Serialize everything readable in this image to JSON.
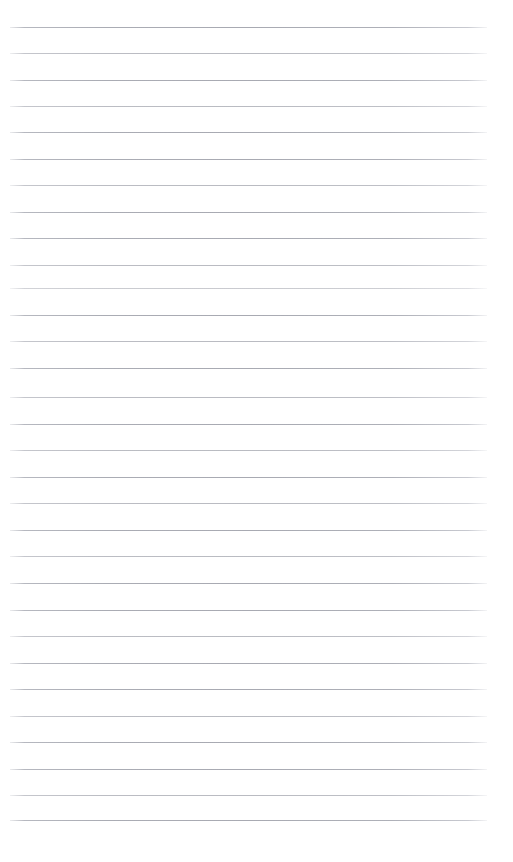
{
  "document": {
    "kind": "lined-paper",
    "title": "Blank ruled paper",
    "background_color": "#ffffff",
    "width_px": 513,
    "height_px": 862,
    "body_text": "",
    "header_text": "",
    "footer_text": ""
  },
  "ruling": {
    "line_color": "#a8aab4",
    "line_thickness_px": 1,
    "line_count": 31,
    "first_line_y": 27,
    "line_spacing_px": 26.4,
    "line_start_x": 10,
    "line_end_x": 487,
    "has_vertical_margin_rule": false,
    "margin_rule_color": "",
    "top_margin_px": 27,
    "bottom_margin_px": 42,
    "left_margin_px": 10,
    "right_margin_px": 26
  },
  "lines": [
    {
      "index": 1,
      "y": 27,
      "opacity_class": ""
    },
    {
      "index": 2,
      "y": 53,
      "opacity_class": "faint"
    },
    {
      "index": 3,
      "y": 80,
      "opacity_class": ""
    },
    {
      "index": 4,
      "y": 106,
      "opacity_class": "faint"
    },
    {
      "index": 5,
      "y": 132,
      "opacity_class": ""
    },
    {
      "index": 6,
      "y": 159,
      "opacity_class": ""
    },
    {
      "index": 7,
      "y": 185,
      "opacity_class": "faint"
    },
    {
      "index": 8,
      "y": 212,
      "opacity_class": ""
    },
    {
      "index": 9,
      "y": 238,
      "opacity_class": ""
    },
    {
      "index": 10,
      "y": 265,
      "opacity_class": "faint"
    },
    {
      "index": 11,
      "y": 288,
      "opacity_class": "faintest"
    },
    {
      "index": 12,
      "y": 315,
      "opacity_class": ""
    },
    {
      "index": 13,
      "y": 341,
      "opacity_class": "faint"
    },
    {
      "index": 14,
      "y": 368,
      "opacity_class": ""
    },
    {
      "index": 15,
      "y": 397,
      "opacity_class": "faint"
    },
    {
      "index": 16,
      "y": 424,
      "opacity_class": ""
    },
    {
      "index": 17,
      "y": 450,
      "opacity_class": "faint"
    },
    {
      "index": 18,
      "y": 477,
      "opacity_class": ""
    },
    {
      "index": 19,
      "y": 503,
      "opacity_class": "faint"
    },
    {
      "index": 20,
      "y": 530,
      "opacity_class": ""
    },
    {
      "index": 21,
      "y": 556,
      "opacity_class": "faint"
    },
    {
      "index": 22,
      "y": 583,
      "opacity_class": ""
    },
    {
      "index": 23,
      "y": 610,
      "opacity_class": ""
    },
    {
      "index": 24,
      "y": 636,
      "opacity_class": "faint"
    },
    {
      "index": 25,
      "y": 663,
      "opacity_class": ""
    },
    {
      "index": 26,
      "y": 689,
      "opacity_class": ""
    },
    {
      "index": 27,
      "y": 716,
      "opacity_class": "faint"
    },
    {
      "index": 28,
      "y": 742,
      "opacity_class": ""
    },
    {
      "index": 29,
      "y": 769,
      "opacity_class": ""
    },
    {
      "index": 30,
      "y": 795,
      "opacity_class": "faint"
    },
    {
      "index": 31,
      "y": 820,
      "opacity_class": ""
    }
  ]
}
